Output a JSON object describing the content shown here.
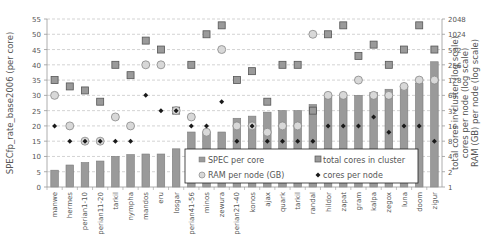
{
  "chart_data": {
    "type": "bar",
    "title": "",
    "ylabel": "SPECfp_rate_base2006 (per core)",
    "y2label_lines": [
      "RAM (GB) per node (log scale)",
      "cores per node (log scale)",
      "total cores in cluster (log scale)"
    ],
    "ylim": [
      0,
      55
    ],
    "yticks": [
      0,
      5,
      10,
      15,
      20,
      25,
      30,
      35,
      40,
      45,
      50,
      55
    ],
    "y2lim": [
      1,
      2048
    ],
    "y2ticks": [
      1,
      2,
      4,
      8,
      16,
      32,
      64,
      128,
      256,
      512,
      1024,
      2048
    ],
    "grid": true,
    "legend_position": "lower-right inside",
    "categories": [
      "manwe",
      "hermes",
      "perian1-10",
      "perian11-20",
      "tarkil",
      "nympha",
      "mandos",
      "eru",
      "losgar",
      "perian41-56",
      "minos",
      "zewura",
      "perian21-40",
      "konos",
      "ajax",
      "quark",
      "tarkil",
      "randal",
      "hildor",
      "zapat",
      "gram",
      "kalpa",
      "zegox",
      "luna",
      "doom",
      "zigur"
    ],
    "series": [
      {
        "name": "SPEC per core",
        "type": "bar",
        "axis": "left",
        "values": [
          5.5,
          7.2,
          8.0,
          8.5,
          10.0,
          10.6,
          10.8,
          10.8,
          12.5,
          18.0,
          18.0,
          18.0,
          22.5,
          23.2,
          24.5,
          25.0,
          25.0,
          27.0,
          30.0,
          29.5,
          30.0,
          31.0,
          32.0,
          33.0,
          34.0,
          41.0
        ]
      },
      {
        "name": "total cores in cluster",
        "type": "marker-square",
        "axis": "right-log",
        "values": [
          128,
          96,
          80,
          48,
          256,
          160,
          768,
          512,
          32,
          256,
          1024,
          1536,
          128,
          192,
          48,
          256,
          256,
          32,
          1024,
          1536,
          384,
          640,
          256,
          512,
          1536,
          512
        ]
      },
      {
        "name": "RAM per node (GB)",
        "type": "marker-circle",
        "axis": "right-log",
        "values": [
          64,
          16,
          8,
          8,
          24,
          16,
          256,
          256,
          32,
          24,
          12,
          512,
          16,
          16,
          12,
          16,
          16,
          1024,
          64,
          64,
          128,
          64,
          64,
          96,
          128,
          128
        ]
      },
      {
        "name": "cores per node",
        "type": "marker-diamond",
        "axis": "right-log",
        "values": [
          16,
          8,
          8,
          8,
          8,
          8,
          64,
          32,
          32,
          16,
          16,
          48,
          8,
          16,
          8,
          8,
          8,
          8,
          16,
          16,
          16,
          24,
          12,
          16,
          16,
          8
        ]
      }
    ]
  },
  "legend": {
    "items": [
      {
        "label": "SPEC per core",
        "icon": "bar-swatch-icon"
      },
      {
        "label": "total cores in cluster",
        "icon": "square-marker-icon"
      },
      {
        "label": "RAM per node (GB)",
        "icon": "circle-marker-icon"
      },
      {
        "label": "cores per node",
        "icon": "diamond-marker-icon"
      }
    ]
  },
  "colors": {
    "bar_fill": "#9a9a9a",
    "bar_stroke": "#7a7a7a",
    "square_fill": "#9a9a9a",
    "square_stroke": "#555555",
    "circle_fill": "#d8d8d8",
    "circle_stroke": "#888888",
    "diamond": "#1a1a1a",
    "grid": "#c8c8c8",
    "axis": "#999999"
  }
}
